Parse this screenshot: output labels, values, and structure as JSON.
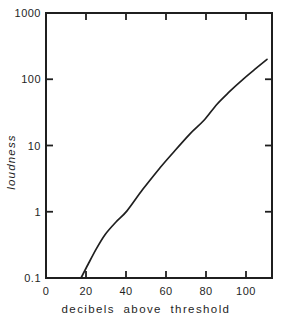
{
  "colors": {
    "ink": "#1f1f1f",
    "background": "#ffffff"
  },
  "chart_data": {
    "type": "line",
    "title": "",
    "xlabel": "decibels above threshold",
    "ylabel": "loudness",
    "x_axis": {
      "scale": "linear",
      "min": 0,
      "max": 113,
      "tick_labels": [
        "0",
        "20",
        "40",
        "60",
        "80",
        "100"
      ],
      "grid": false
    },
    "y_axis": {
      "scale": "log",
      "min": 0.1,
      "max": 1000,
      "tick_labels": [
        "0.1",
        "1",
        "10",
        "100",
        "1000"
      ],
      "grid": false
    },
    "legend": false,
    "series": [
      {
        "name": "loudness curve",
        "points": [
          [
            17.5,
            0.1
          ],
          [
            21,
            0.16
          ],
          [
            25,
            0.27
          ],
          [
            29.5,
            0.45
          ],
          [
            35,
            0.7
          ],
          [
            40.5,
            1.03
          ],
          [
            48.5,
            2.2
          ],
          [
            57,
            4.6
          ],
          [
            64.5,
            8.4
          ],
          [
            72,
            15
          ],
          [
            79,
            24
          ],
          [
            85.5,
            42
          ],
          [
            92,
            66
          ],
          [
            98.5,
            100
          ],
          [
            104.5,
            142
          ],
          [
            110.5,
            200
          ]
        ]
      }
    ]
  }
}
